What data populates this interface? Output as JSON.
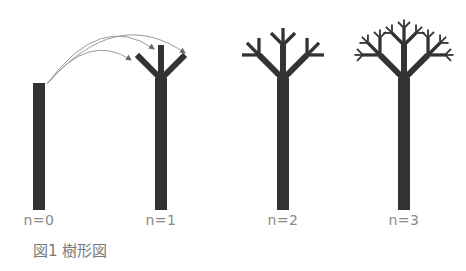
{
  "figure": {
    "caption": "図1 樹形図",
    "colors": {
      "tree": "#333333",
      "arrow": "#9a9a9a",
      "label": "#8a8a8a"
    },
    "panels": [
      {
        "label": "n=0",
        "depth": 0,
        "cx": 39
      },
      {
        "label": "n=1",
        "depth": 1,
        "cx": 161
      },
      {
        "label": "n=2",
        "depth": 2,
        "cx": 283
      },
      {
        "label": "n=3",
        "depth": 3,
        "cx": 404
      }
    ],
    "geometry": {
      "trunk_bottom": 210,
      "trunk_top_n0": 83,
      "fork_y": 79,
      "trunk_width": 12,
      "branch_length": 34,
      "branch_width": 6,
      "scale": 0.5,
      "angles_deg": [
        -45,
        0,
        45
      ]
    },
    "arrows": [
      {
        "from": [
          47,
          84
        ],
        "to": [
          131,
          60
        ]
      },
      {
        "from": [
          47,
          84
        ],
        "to": [
          154,
          49
        ]
      },
      {
        "from": [
          47,
          84
        ],
        "to": [
          185,
          53
        ]
      }
    ]
  }
}
